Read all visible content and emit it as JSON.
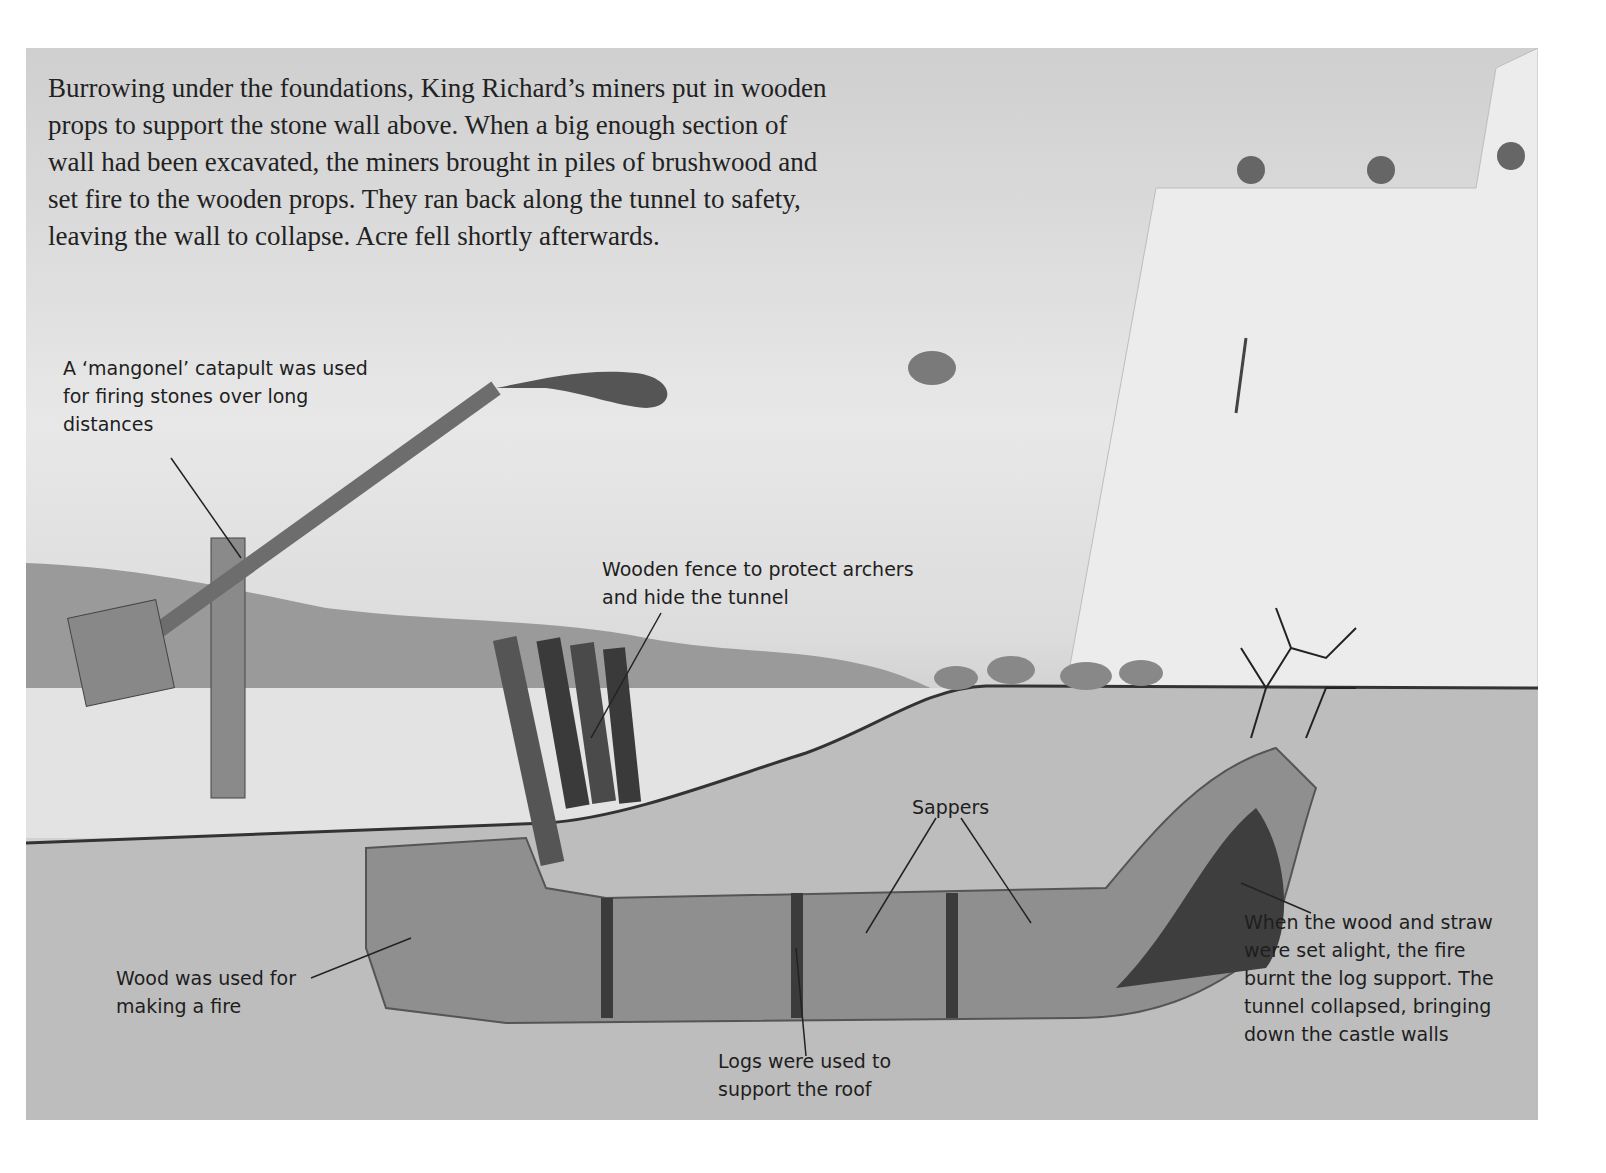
{
  "intro_text": "Burrowing under the foundations, King Richard’s miners put in wooden props to support the stone wall above. When a big enough section of wall had been excavated, the miners brought in piles of brushwood and set fire to the wooden props. They ran back along the tunnel to safety, leaving the wall to collapse. Acre fell shortly afterwards.",
  "labels": {
    "mangonel": "A ‘mangonel’ catapult was used for firing stones over long distances",
    "fence": "Wooden fence to protect archers and hide the tunnel",
    "sappers": "Sappers",
    "wood": "Wood was used for making a fire",
    "logs": "Logs were used to support the roof",
    "fire": "When the wood and straw were set alight, the fire burnt the log support. The tunnel collapsed, bringing down the castle walls"
  },
  "colors": {
    "sky": "#e6e6e6",
    "earth": "#b8b8b8",
    "tunnel": "#8f8f8f",
    "wall": "#e9e9e9",
    "text": "#1e1e1e"
  }
}
